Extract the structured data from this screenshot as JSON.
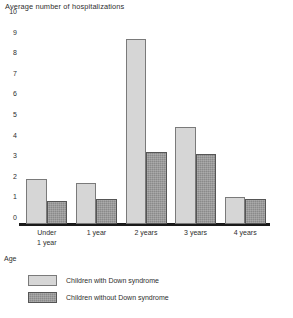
{
  "chart_data": {
    "type": "bar",
    "title": "Average number of hospitalizations",
    "xlabel": "Age",
    "ylabel": "",
    "ylim": [
      0,
      10
    ],
    "yticks": [
      0,
      1,
      2,
      3,
      4,
      5,
      6,
      7,
      8,
      9,
      10
    ],
    "grid": false,
    "legend_position": "bottom-left",
    "categories": [
      "Under\n1 year",
      "1 year",
      "2 years",
      "3 years",
      "4 years"
    ],
    "series": [
      {
        "name": "Children with Down syndrome",
        "color": "#d6d6d6",
        "values": [
          2.2,
          2.0,
          9.0,
          4.7,
          1.3
        ]
      },
      {
        "name": "Children without Down syndrome",
        "color": "#8a8a8a",
        "values": [
          1.1,
          1.2,
          3.5,
          3.4,
          1.2
        ]
      }
    ]
  }
}
